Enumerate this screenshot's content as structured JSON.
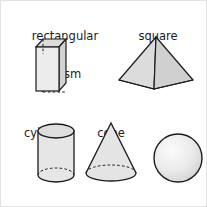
{
  "diagram": {
    "background_color": "#ffffff",
    "outline_color": "#1b1b1b",
    "fill_color": "#e6e6e6",
    "shade_color": "#d2d2d2",
    "hidden_edge_style": "dashed",
    "figures": [
      {
        "id": "rectangular-prism",
        "label": "rectangular\nprism",
        "label_line_1": "rectangular",
        "label_line_2": "prism",
        "shape_type": "rectangular prism",
        "row": 1,
        "column": 1
      },
      {
        "id": "square-pyramid",
        "label": "square\npyramid",
        "label_line_1": "square",
        "label_line_2": "pyramid",
        "shape_type": "square pyramid",
        "row": 1,
        "column": 2
      },
      {
        "id": "cylinder",
        "label": "cylinder",
        "label_line_1": "cylinder",
        "label_line_2": "",
        "shape_type": "cylinder",
        "row": 2,
        "column": 1
      },
      {
        "id": "cone",
        "label": "cone",
        "label_line_1": "cone",
        "label_line_2": "",
        "shape_type": "cone",
        "row": 2,
        "column": 2
      },
      {
        "id": "sphere",
        "label": "sphere",
        "label_line_1": "sphere",
        "label_line_2": "",
        "shape_type": "sphere",
        "row": 2,
        "column": 3
      }
    ]
  }
}
